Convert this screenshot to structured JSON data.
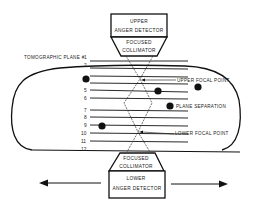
{
  "diagram": {
    "upper_detector": {
      "line1": "UPPER",
      "line2": "ANGER DETECTOR"
    },
    "upper_collimator": {
      "line1": "FOCUSED",
      "line2": "COLLIMATOR"
    },
    "lower_collimator": {
      "line1": "FOCUSED",
      "line2": "COLLIMATOR"
    },
    "lower_detector": {
      "line1": "LOWER",
      "line2": "ANGER DETECTOR"
    },
    "plane_label": "TOMOGRAPHIC PLANE #",
    "planes": [
      "1",
      "2",
      "3",
      "4",
      "5",
      "6",
      "7",
      "8",
      "9",
      "10",
      "11",
      "12"
    ],
    "annotations": {
      "upper_focal": "UPPER FOCAL POINT",
      "plane_sep": "PLANE SEPARATION",
      "lower_focal": "LOWER FOCAL POINT"
    },
    "colors": {
      "ink": "#111111",
      "background": "#ffffff"
    }
  }
}
